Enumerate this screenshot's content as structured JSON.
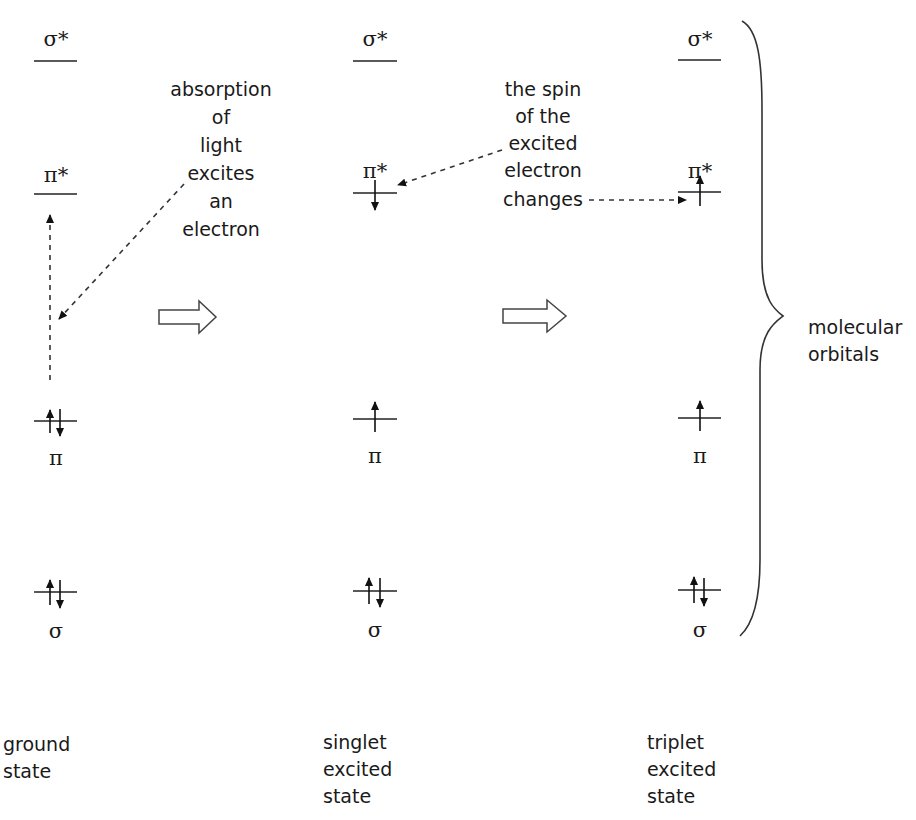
{
  "columns": [
    {
      "id": "ground",
      "state_label": [
        "ground",
        "state"
      ],
      "orbitals": [
        {
          "name": "σ*",
          "electrons": "none"
        },
        {
          "name": "π*",
          "electrons": "none"
        },
        {
          "name": "π",
          "electrons": "up-down"
        },
        {
          "name": "σ",
          "electrons": "up-down"
        }
      ]
    },
    {
      "id": "singlet",
      "state_label": [
        "singlet",
        "excited",
        "state"
      ],
      "orbitals": [
        {
          "name": "σ*",
          "electrons": "none"
        },
        {
          "name": "π*",
          "electrons": "down"
        },
        {
          "name": "π",
          "electrons": "up"
        },
        {
          "name": "σ",
          "electrons": "up-down"
        }
      ]
    },
    {
      "id": "triplet",
      "state_label": [
        "triplet",
        "excited",
        "state"
      ],
      "orbitals": [
        {
          "name": "σ*",
          "electrons": "none"
        },
        {
          "name": "π*",
          "electrons": "up"
        },
        {
          "name": "π",
          "electrons": "up"
        },
        {
          "name": "σ",
          "electrons": "up-down"
        }
      ]
    }
  ],
  "annotations": {
    "absorption": [
      "absorption",
      "of",
      "light",
      "excites",
      "an",
      "electron"
    ],
    "spin_change": [
      "the spin",
      "of the",
      "excited",
      "electron",
      "changes"
    ]
  },
  "brace_label": [
    "molecular",
    "orbitals"
  ],
  "transitions": [
    {
      "from": "ground",
      "to": "singlet",
      "style": "hollow-arrow"
    },
    {
      "from": "singlet",
      "to": "triplet",
      "style": "hollow-arrow"
    }
  ],
  "colors": {
    "ink": "#1a1a1a",
    "background": "#ffffff"
  }
}
